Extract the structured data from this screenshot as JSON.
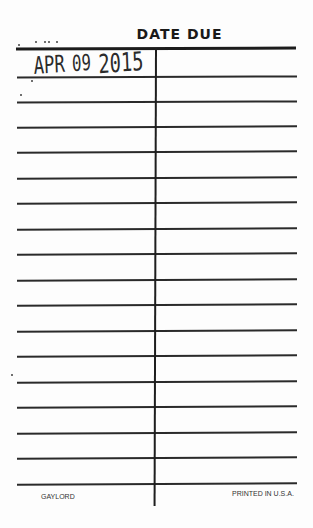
{
  "card": {
    "title": "DATE DUE",
    "stamps": [
      {
        "row": 1,
        "column": "left",
        "text": "APR 09 2015",
        "month": "APR",
        "day": "09",
        "year": "2015"
      }
    ],
    "rows": 17,
    "columns": 2,
    "footer": {
      "left": "GAYLORD",
      "right": "PRINTED IN U.S.A."
    }
  },
  "colors": {
    "ink": "#1c1c1c",
    "paper": "#fdfdfd"
  }
}
